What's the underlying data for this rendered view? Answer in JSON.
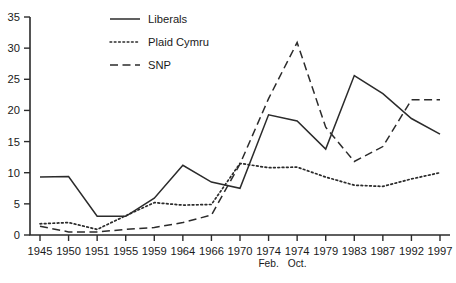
{
  "chart_data": {
    "type": "line",
    "title": "",
    "subtitle": "",
    "xlabel": "",
    "ylabel": "",
    "xlim_categories": true,
    "ylim": [
      0,
      35
    ],
    "grid": false,
    "legend_position": "top-center",
    "y_ticks": [
      0,
      5,
      10,
      15,
      20,
      25,
      30,
      35
    ],
    "y_tick_labels": [
      "0",
      "5",
      "10",
      "15",
      "20",
      "25",
      "30",
      "35"
    ],
    "categories": [
      "1945",
      "1950",
      "1951",
      "1955",
      "1959",
      "1964",
      "1966",
      "1970",
      "1974",
      "1974",
      "1979",
      "1983",
      "1987",
      "1992",
      "1997"
    ],
    "category_sublabels": [
      "",
      "",
      "",
      "",
      "",
      "",
      "",
      "",
      "Feb.",
      "Oct.",
      "",
      "",
      "",
      "",
      ""
    ],
    "series": [
      {
        "name": "Liberals",
        "style": "solid",
        "values": [
          9.3,
          9.4,
          3.0,
          3.0,
          5.9,
          11.2,
          8.5,
          7.5,
          19.3,
          18.3,
          13.8,
          25.6,
          22.7,
          18.7,
          16.2
        ]
      },
      {
        "name": "Plaid Cymru",
        "style": "dotted",
        "values": [
          1.8,
          2.0,
          0.9,
          3.1,
          5.2,
          4.8,
          4.9,
          11.5,
          10.8,
          10.9,
          9.3,
          8.0,
          7.8,
          9.0,
          10.0
        ]
      },
      {
        "name": "SNP",
        "style": "dashed",
        "values": [
          1.4,
          0.5,
          0.5,
          0.9,
          1.2,
          2.0,
          3.2,
          11.4,
          21.9,
          30.9,
          17.3,
          11.8,
          14.2,
          21.7,
          21.7
        ]
      }
    ]
  },
  "legend": {
    "entries": [
      {
        "label": "Liberals",
        "style": "solid"
      },
      {
        "label": "Plaid Cymru",
        "style": "dotted"
      },
      {
        "label": "SNP",
        "style": "dashed"
      }
    ]
  },
  "colors": {
    "ink": "#2b2b2b",
    "background": "#ffffff"
  }
}
